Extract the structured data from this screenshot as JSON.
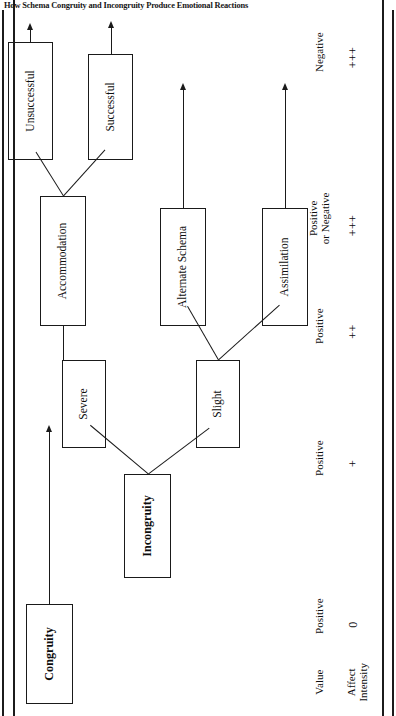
{
  "figure": {
    "title": "How Schema Congruity and Incongruity Produce Emotional Reactions",
    "orientation": "rotated-90-ccw"
  },
  "diagram": {
    "type": "tree",
    "nodes": {
      "congruity": "Congruity",
      "incongruity": "Incongruity",
      "slight": "Slight",
      "severe": "Severe",
      "assimilation": "Assimilation",
      "alternate_schema": "Alternate Schema",
      "accommodation": "Accommodation",
      "successful": "Successful",
      "unsuccessful": "Unsuccessful"
    },
    "row_labels": {
      "value": "Value",
      "affect_intensity": "Affect\nIntensity"
    },
    "outcomes": [
      {
        "from": "congruity",
        "value": "Positive",
        "affect_intensity": "0"
      },
      {
        "from": "assimilation",
        "value": "Positive",
        "affect_intensity": "+"
      },
      {
        "from": "alternate_schema",
        "value": "Positive",
        "affect_intensity": "++"
      },
      {
        "from": "successful",
        "value": "Positive\nor Negative",
        "affect_intensity": "+++"
      },
      {
        "from": "unsuccessful",
        "value": "Negative",
        "affect_intensity": "+++"
      }
    ],
    "edges": [
      {
        "from": "incongruity",
        "to": "slight"
      },
      {
        "from": "incongruity",
        "to": "severe"
      },
      {
        "from": "slight",
        "to": "assimilation"
      },
      {
        "from": "slight",
        "to": "alternate_schema"
      },
      {
        "from": "severe",
        "to": "accommodation"
      },
      {
        "from": "accommodation",
        "to": "successful"
      },
      {
        "from": "accommodation",
        "to": "unsuccessful"
      }
    ],
    "colors": {
      "ink": "#1a1a1a",
      "background": "#ffffff"
    }
  }
}
